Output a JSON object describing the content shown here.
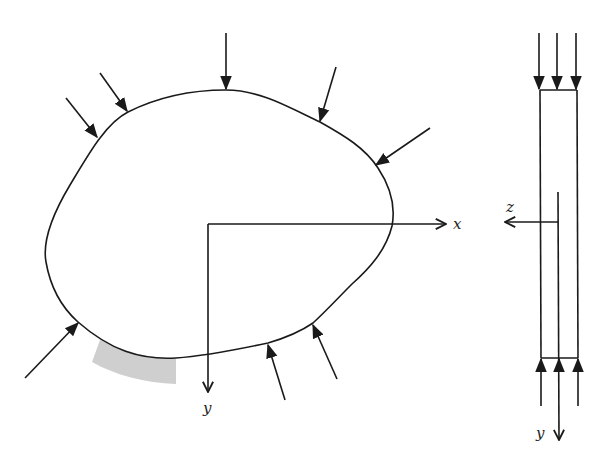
{
  "diagram": {
    "type": "plane stress cross-section with surface loads",
    "colors": {
      "stroke": "#1a1a1a",
      "shade": "#c8c8c8",
      "background": "#ffffff"
    },
    "left_view": {
      "axes": {
        "x_label": "x",
        "y_label": "y"
      },
      "boundary_load_arrows": 8,
      "shaded_element": "surface strip on lower-left boundary"
    },
    "right_view": {
      "axes": {
        "z_label": "z",
        "y_label": "y"
      },
      "top_load_arrows": 3,
      "bottom_load_arrows": 3
    }
  }
}
